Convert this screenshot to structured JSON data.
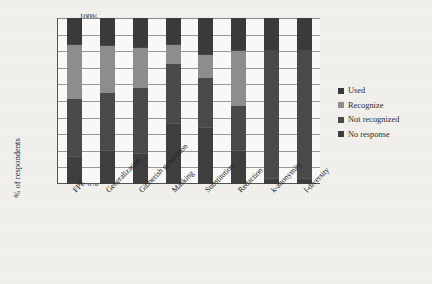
{
  "chart_data": {
    "type": "bar",
    "stacked": true,
    "stack_total": 100,
    "title": "",
    "xlabel": "",
    "ylabel": "% of respondents",
    "ylim": [
      0,
      100
    ],
    "ytick_labels": [
      "100%",
      "90%",
      "80%",
      "70%",
      "60%",
      "50%",
      "40%",
      "30%",
      "20%",
      "10%",
      "0%"
    ],
    "ytick_values": [
      100,
      90,
      80,
      70,
      60,
      50,
      40,
      30,
      20,
      10,
      0
    ],
    "grid": true,
    "legend_position": "right",
    "categories": [
      "FPE",
      "Generalization",
      "Gibberish generation",
      "Masking",
      "Substitution",
      "Redaction",
      "k-anonymity",
      "l-diversity"
    ],
    "series": [
      {
        "name": "Used",
        "color": "#3b3b3b",
        "values": [
          16,
          17,
          18,
          16,
          22,
          20,
          20,
          20
        ]
      },
      {
        "name": "Recognize",
        "color": "#8e8e8c",
        "values": [
          33,
          28,
          24,
          12,
          14,
          33,
          0,
          0
        ]
      },
      {
        "name": "Not recognized",
        "color": "#4a4a4a",
        "values": [
          35,
          35,
          40,
          36,
          30,
          27,
          77,
          77
        ]
      },
      {
        "name": "No response",
        "color": "#3f3f3f",
        "values": [
          16,
          20,
          18,
          36,
          34,
          20,
          3,
          3
        ]
      }
    ],
    "legend_entries": [
      {
        "label": "Used",
        "color": "#3b3b3b"
      },
      {
        "label": "Recognize",
        "color": "#8e8e8c"
      },
      {
        "label": "Not recognized",
        "color": "#4a4a4a"
      },
      {
        "label": "No response",
        "color": "#3f3f3f"
      }
    ]
  }
}
